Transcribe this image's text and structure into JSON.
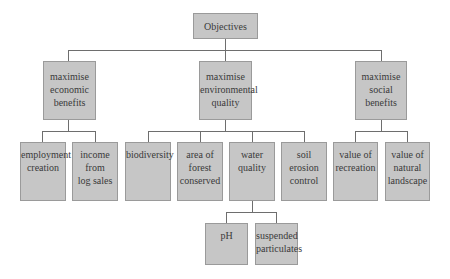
{
  "diagram": {
    "type": "hierarchy",
    "root": {
      "label": "Objectives"
    },
    "level2": [
      {
        "label": "maximise\neconomic\nbenefits"
      },
      {
        "label": "maximise\nenvironmental\nquality"
      },
      {
        "label": "maximise\nsocial\nbenefits"
      }
    ],
    "level3": [
      {
        "label": "employment\ncreation",
        "parent": "maximise economic benefits"
      },
      {
        "label": "income\nfrom\nlog sales",
        "parent": "maximise economic benefits"
      },
      {
        "label": "biodiversity",
        "parent": "maximise environmental quality"
      },
      {
        "label": "area of\nforest\nconserved",
        "parent": "maximise environmental quality"
      },
      {
        "label": "water\nquality",
        "parent": "maximise environmental quality"
      },
      {
        "label": "soil\nerosion\ncontrol",
        "parent": "maximise environmental quality"
      },
      {
        "label": "value of\nrecreation",
        "parent": "maximise social benefits"
      },
      {
        "label": "value of\nnatural\nlandscape",
        "parent": "maximise social benefits"
      }
    ],
    "level4": [
      {
        "label": "pH",
        "parent": "water quality"
      },
      {
        "label": "suspended\nparticulates",
        "parent": "water quality"
      }
    ],
    "colors": {
      "box_fill": "#c6c6c6",
      "box_border": "#9a9a9a",
      "connector": "#6e6e6e",
      "text": "#3a3a3a"
    }
  }
}
